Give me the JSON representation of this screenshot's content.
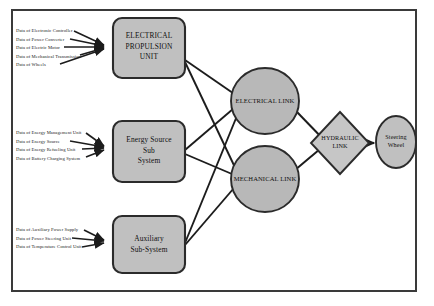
{
  "diagram": {
    "type": "block-flow-diagram",
    "frame": {
      "border_color": "#3a3a3a"
    },
    "colors": {
      "node_fill": "#c0c0c0",
      "node_stroke": "#2b2b2b",
      "connector": "#1c1c1c",
      "background": "#ffffff",
      "text": "#101010"
    },
    "source_groups": [
      {
        "name": "electrical-propulsion-inputs",
        "target": "ELECTRICAL PROPULSION UNIT",
        "labels": [
          "Data of Electronic Controller",
          "Data of Power Converter",
          "Data of Electric Motor",
          "Data of Mechanical Transmission",
          "Data of Wheels"
        ]
      },
      {
        "name": "energy-source-inputs",
        "target": "Energy Source Sub System",
        "labels": [
          "Data of Energy Management Unit",
          "Data of Energy Source",
          "Data of Energy Refueling Unit",
          "Data of Battery Charging System"
        ]
      },
      {
        "name": "auxiliary-inputs",
        "target": "Auxiliary Sub-System",
        "labels": [
          "Data of Auxiliary Power Supply",
          "Data of Power Steering Unit",
          "Data of Temperature Control Unit"
        ]
      }
    ],
    "nodes": {
      "electrical_propulsion_unit": {
        "shape": "rounded-rectangle",
        "label": "ELECTRICAL\nPROPULSION\nUNIT"
      },
      "energy_source_sub_system": {
        "shape": "rounded-rectangle",
        "label": "Energy Source\nSub\nSystem"
      },
      "auxiliary_sub_system": {
        "shape": "rounded-rectangle",
        "label": "Auxiliary\nSub-System"
      },
      "electrical_link": {
        "shape": "ellipse",
        "label": "ELECTRICAL LINK"
      },
      "mechanical_link": {
        "shape": "ellipse",
        "label": "MECHANICAL LINK"
      },
      "hydraulic_link": {
        "shape": "diamond",
        "label": "HYDRAULIC\nLINK"
      },
      "steering_wheel": {
        "shape": "ellipse",
        "label": "Steering\nWheel"
      }
    },
    "edges": [
      {
        "from": "electrical_propulsion_unit",
        "to": "electrical_link"
      },
      {
        "from": "electrical_propulsion_unit",
        "to": "mechanical_link"
      },
      {
        "from": "energy_source_sub_system",
        "to": "electrical_link"
      },
      {
        "from": "energy_source_sub_system",
        "to": "mechanical_link"
      },
      {
        "from": "auxiliary_sub_system",
        "to": "electrical_link"
      },
      {
        "from": "auxiliary_sub_system",
        "to": "mechanical_link"
      },
      {
        "from": "electrical_link",
        "to": "hydraulic_link"
      },
      {
        "from": "mechanical_link",
        "to": "hydraulic_link"
      },
      {
        "from": "hydraulic_link",
        "to": "steering_wheel"
      }
    ]
  }
}
